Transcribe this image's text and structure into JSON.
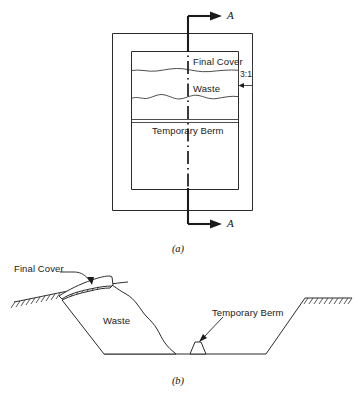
{
  "figure": {
    "type": "engineering-diagram",
    "panels": [
      {
        "id": "a",
        "caption": "(a)",
        "view": "plan",
        "labels": {
          "final_cover": "Final Cover",
          "waste": "Waste",
          "temporary_berm": "Temporary Berm",
          "slope_ratio": "3:1"
        },
        "section_marks": {
          "top": "A",
          "bottom": "A"
        }
      },
      {
        "id": "b",
        "caption": "(b)",
        "view": "section",
        "labels": {
          "final_cover": "Final Cover",
          "waste": "Waste",
          "temporary_berm": "Temporary Berm"
        }
      }
    ]
  },
  "colors": {
    "line": "#2b2b2b",
    "heavy_line": "#1a1a1a",
    "background": "#ffffff",
    "text": "#1a1a1a"
  },
  "icons": {
    "section_arrow": "arrow-right-icon",
    "leader_arrow": "leader-arrow-icon",
    "ground_hatch": "ground-hatch-icon",
    "centerline": "section-centerline-icon"
  }
}
